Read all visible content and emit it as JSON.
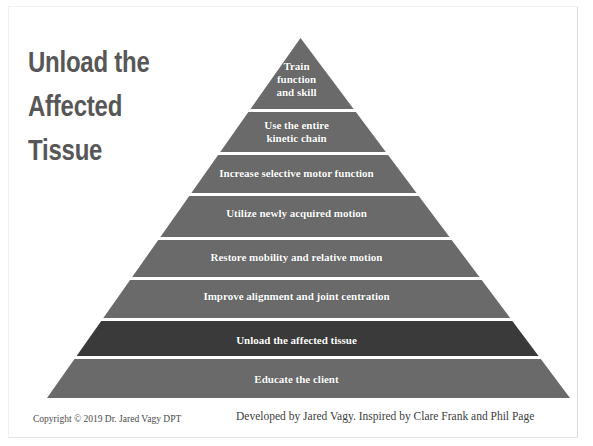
{
  "slide": {
    "title_lines": [
      "Unload the",
      "Affected",
      "Tissue"
    ],
    "background_color": "#ffffff",
    "title_color": "#575757"
  },
  "chart_data": {
    "type": "pyramid",
    "title": "Unload the Affected Tissue",
    "orientation": "apex-top",
    "level_count": 8,
    "band_normal_color": "#6a6a6a",
    "band_highlight_color": "#3a3a3a",
    "separator_color": "#ffffff",
    "label_color": "#ffffff",
    "note": "Levels listed from apex (top, level 1) down to base (level 8). 'Unload the affected tissue' is rendered in a darker shade to highlight it.",
    "levels": [
      {
        "level": 1,
        "position": "top",
        "label": "Train function and skill",
        "label_lines": [
          "Train",
          "function",
          "and skill"
        ],
        "highlighted": false,
        "color": "#6a6a6a"
      },
      {
        "level": 2,
        "position": "2",
        "label": "Use the entire kinetic chain",
        "label_lines": [
          "Use the entire",
          "kinetic chain"
        ],
        "highlighted": false,
        "color": "#6a6a6a"
      },
      {
        "level": 3,
        "position": "3",
        "label": "Increase selective motor function",
        "label_lines": [
          "Increase selective motor function"
        ],
        "highlighted": false,
        "color": "#6a6a6a"
      },
      {
        "level": 4,
        "position": "4",
        "label": "Utilize newly acquired motion",
        "label_lines": [
          "Utilize newly acquired motion"
        ],
        "highlighted": false,
        "color": "#6a6a6a"
      },
      {
        "level": 5,
        "position": "5",
        "label": "Restore mobility and relative motion",
        "label_lines": [
          "Restore mobility and relative motion"
        ],
        "highlighted": false,
        "color": "#6a6a6a"
      },
      {
        "level": 6,
        "position": "6",
        "label": "Improve alignment and joint centration",
        "label_lines": [
          "Improve alignment and joint centration"
        ],
        "highlighted": false,
        "color": "#6a6a6a"
      },
      {
        "level": 7,
        "position": "7",
        "label": "Unload the affected tissue",
        "label_lines": [
          "Unload the affected tissue"
        ],
        "highlighted": true,
        "color": "#3a3a3a"
      },
      {
        "level": 8,
        "position": "base",
        "label": "Educate the client",
        "label_lines": [
          "Educate the client"
        ],
        "highlighted": false,
        "color": "#6a6a6a"
      }
    ]
  },
  "footer": {
    "copyright": "Copyright © 2019 Dr. Jared Vagy DPT",
    "credit": "Developed by Jared Vagy. Inspired by Clare Frank and Phil Page"
  }
}
